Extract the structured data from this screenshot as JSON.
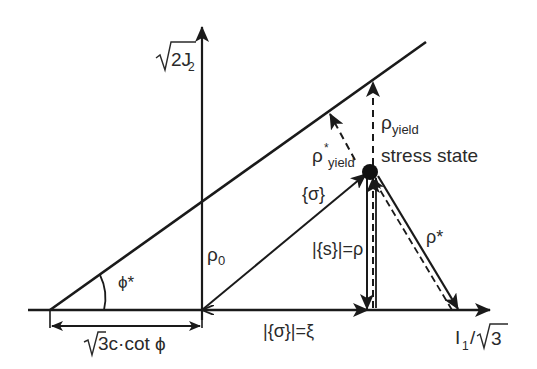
{
  "diagram": {
    "type": "stress-invariant-space",
    "axes": {
      "vertical_label": "√2J₂",
      "vertical_label_parts": {
        "root": "2J",
        "sub": "2"
      },
      "horizontal_label_parts": {
        "main": "I",
        "sub": "1",
        "slash": "/",
        "root": "3"
      }
    },
    "labels": {
      "phi_star": "ϕ*",
      "rho_0": "ρ",
      "rho_0_sub": "0",
      "cohesion_offset_root": "3c·cot ϕ",
      "sigma": "{σ}",
      "s_eq_rho": "|{s}|=ρ",
      "xi": "|{σ}|=ξ",
      "rho_star": "ρ*",
      "rho_yield": "ρ",
      "rho_yield_sub": "yield",
      "rho_star_yield": "ρ",
      "rho_star_yield_sup": "*",
      "rho_star_yield_sub": "yield",
      "stress_state": "stress state"
    },
    "colors": {
      "ink": "#1a1a1a",
      "background": "#ffffff"
    }
  }
}
